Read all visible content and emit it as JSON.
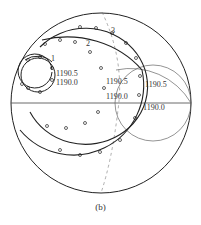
{
  "figure": {
    "caption": "(b)",
    "type": "Smith chart with impedance loci"
  },
  "curves": [
    {
      "id": "1",
      "label": "1",
      "freq_labels": [
        "1190.5",
        "1190.0"
      ]
    },
    {
      "id": "2",
      "label": "2",
      "freq_labels": [
        "1190.5",
        "1190.0"
      ]
    },
    {
      "id": "3",
      "label": "3",
      "freq_labels": [
        "1190.5",
        "1190.0"
      ]
    }
  ],
  "markers": {
    "circle": "o",
    "cross": "x"
  },
  "colors": {
    "ink": "#222222",
    "grid": "#555555",
    "background": "#ffffff"
  }
}
